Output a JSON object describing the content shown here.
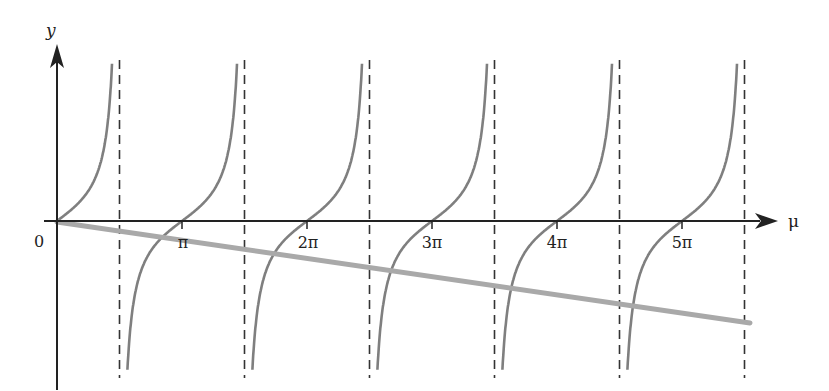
{
  "chart_data": {
    "type": "line",
    "title": "",
    "xlabel": "μ",
    "ylabel": "y",
    "origin_label": "0",
    "x_ticks": [
      {
        "value": 3.14159,
        "label": "π"
      },
      {
        "value": 6.28319,
        "label": "2π"
      },
      {
        "value": 9.42478,
        "label": "3π"
      },
      {
        "value": 12.56637,
        "label": "4π"
      },
      {
        "value": 15.70796,
        "label": "5π"
      }
    ],
    "xlim": [
      0,
      17.28
    ],
    "asymptotes_x": [
      1.5708,
      4.7124,
      7.854,
      10.9956,
      14.1372,
      17.2788
    ],
    "series": [
      {
        "name": "tan(μ)",
        "function": "tan",
        "color": "#808080",
        "style": "solid"
      },
      {
        "name": "linear",
        "function": "-k·μ",
        "slope_px": -0.147,
        "color": "#a6a6a6",
        "style": "solid-thick",
        "x": [
          0,
          17.28
        ],
        "y_relative": "falls from 0 at origin to about -0.3 of lower half at right end"
      }
    ],
    "asymptote_style": "dashed",
    "grid": false,
    "legend": null
  },
  "labels": {
    "y_axis": "y",
    "x_axis": "μ",
    "origin": "0",
    "ticks": [
      "π",
      "2π",
      "3π",
      "4π",
      "5π"
    ]
  }
}
